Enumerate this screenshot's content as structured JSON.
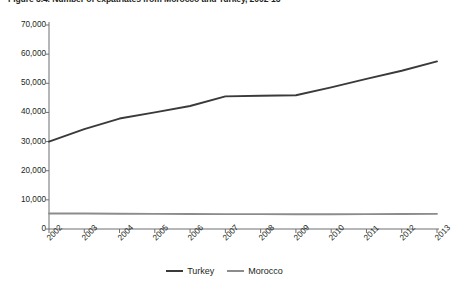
{
  "figure": {
    "title": "Figure 3.4. Number of expatriates from Morocco and Turkey, 2002-13"
  },
  "legend": {
    "entries": [
      {
        "label": "Turkey",
        "color": "#3a3a3a"
      },
      {
        "label": "Morocco",
        "color": "#8c8c8c"
      }
    ]
  },
  "chart_data": {
    "type": "line",
    "title": "Figure 3.4. Number of expatriates from Morocco and Turkey, 2002-13",
    "xlabel": "",
    "ylabel": "",
    "categories": [
      "2002",
      "2003",
      "2004",
      "2005",
      "2006",
      "2007",
      "2008",
      "2009",
      "2010",
      "2011",
      "2012",
      "2013"
    ],
    "x_tick_labels": [
      "2002",
      "2003",
      "2004",
      "2005",
      "2006",
      "2007",
      "2008",
      "2009",
      "2010",
      "2011",
      "2012",
      "2013"
    ],
    "y_tick_labels": [
      "0",
      "10,000",
      "20,000",
      "30,000",
      "40,000",
      "50,000",
      "60,000",
      "70,000"
    ],
    "y_ticks": [
      0,
      10000,
      20000,
      30000,
      40000,
      50000,
      60000,
      70000
    ],
    "ylim": [
      0,
      70000
    ],
    "grid": false,
    "legend_position": "bottom-center",
    "series": [
      {
        "name": "Turkey",
        "color": "#3a3a3a",
        "values": [
          30000,
          34300,
          37900,
          40000,
          42200,
          45500,
          45700,
          45900,
          48600,
          51500,
          54300,
          57500
        ]
      },
      {
        "name": "Morocco",
        "color": "#8c8c8c",
        "values": [
          5300,
          5300,
          5250,
          5200,
          5150,
          5100,
          5100,
          5050,
          5050,
          5100,
          5150,
          5200
        ]
      }
    ]
  }
}
